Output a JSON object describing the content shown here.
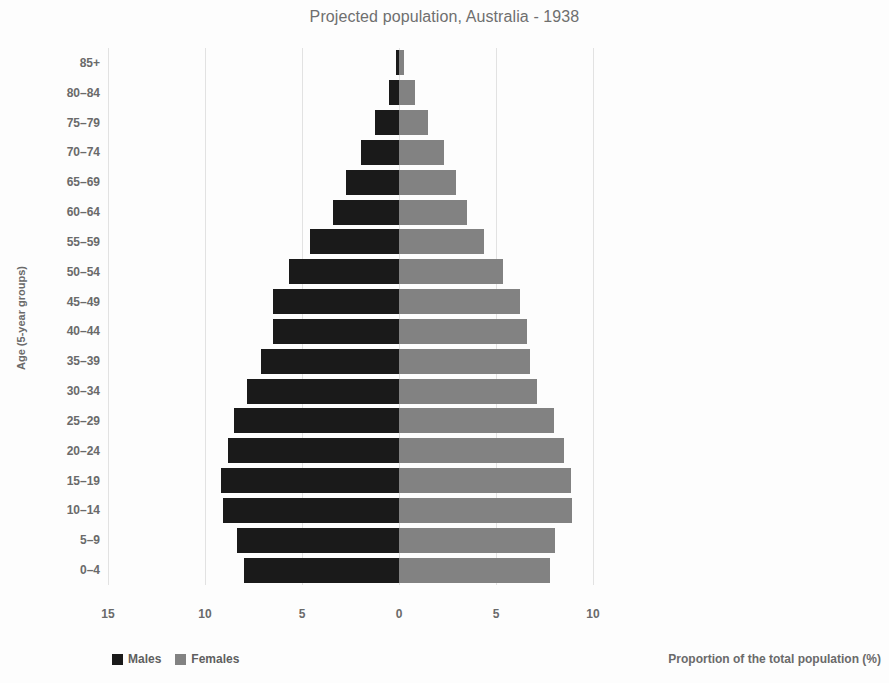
{
  "chart_data": {
    "type": "bar",
    "subtype": "population-pyramid",
    "title": "Projected population, Australia - 1938",
    "xlabel": "Proportion of the total population (%)",
    "ylabel": "Age (5-year groups)",
    "categories": [
      "0–4",
      "5–9",
      "10–14",
      "15–19",
      "20–24",
      "25–29",
      "30–34",
      "35–39",
      "40–44",
      "45–49",
      "50–54",
      "55–59",
      "60–64",
      "65–69",
      "70–74",
      "75–79",
      "80–84",
      "85+"
    ],
    "series": [
      {
        "name": "Males",
        "color": "#1a1a1a",
        "direction": "left",
        "values": [
          8.0,
          8.35,
          9.05,
          9.2,
          8.8,
          8.5,
          7.85,
          7.1,
          6.5,
          6.5,
          5.65,
          4.6,
          3.4,
          2.75,
          1.95,
          1.25,
          0.5,
          0.15
        ]
      },
      {
        "name": "Females",
        "color": "#828282",
        "direction": "right",
        "values": [
          7.8,
          8.05,
          8.9,
          8.85,
          8.5,
          8.0,
          7.1,
          6.75,
          6.6,
          6.25,
          5.35,
          4.4,
          3.5,
          2.95,
          2.3,
          1.5,
          0.85,
          0.25
        ]
      }
    ],
    "x_ticks": [
      {
        "label": "15",
        "value": -15
      },
      {
        "label": "10",
        "value": -10
      },
      {
        "label": "5",
        "value": -5
      },
      {
        "label": "0",
        "value": 0
      },
      {
        "label": "5",
        "value": 5
      },
      {
        "label": "10",
        "value": 10
      }
    ],
    "xlim": [
      -15,
      10
    ],
    "grid": true,
    "legend_position": "bottom-left"
  },
  "legend": {
    "males_label": "Males",
    "females_label": "Females"
  }
}
